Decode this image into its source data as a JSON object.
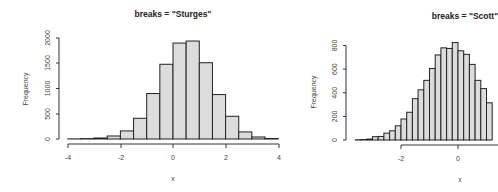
{
  "chart_data": [
    {
      "type": "bar",
      "subtype": "histogram",
      "title": "breaks = \"Sturges\"",
      "xlabel": "x",
      "ylabel": "Frequency",
      "bin_width": 0.5,
      "breaks": [
        -4,
        -3.5,
        -3,
        -2.5,
        -2,
        -1.5,
        -1,
        -0.5,
        0,
        0.5,
        1,
        1.5,
        2,
        2.5,
        3,
        3.5,
        4
      ],
      "values": [
        2,
        8,
        20,
        60,
        160,
        410,
        900,
        1480,
        1900,
        1940,
        1510,
        880,
        450,
        140,
        40,
        10
      ],
      "xticks": [
        -4,
        -2,
        0,
        2,
        4
      ],
      "yticks": [
        0,
        500,
        1000,
        1500,
        2000
      ],
      "xlim": [
        -4,
        4
      ],
      "ylim": [
        0,
        2000
      ],
      "grid": false
    },
    {
      "type": "bar",
      "subtype": "histogram",
      "title": "breaks = \"Scott\"",
      "xlabel": "x",
      "ylabel": "Frequency",
      "bin_width": 0.2,
      "breaks_start": -3.6,
      "values": [
        2,
        4,
        8,
        28,
        30,
        58,
        78,
        120,
        178,
        235,
        350,
        425,
        505,
        605,
        720,
        780,
        775,
        825,
        755,
        725,
        640,
        505,
        435,
        315
      ],
      "xticks": [
        -2,
        0
      ],
      "yticks": [
        0,
        200,
        400,
        600,
        800
      ],
      "ylim": [
        0,
        800
      ],
      "grid": false,
      "note": "right portion of figure cropped"
    }
  ],
  "left": {
    "title": "breaks = \"Sturges\"",
    "xlabel": "x",
    "ylabel": "Frequency",
    "xticks": [
      "-4",
      "-2",
      "0",
      "2",
      "4"
    ],
    "yticks": [
      "0",
      "500",
      "1000",
      "1500",
      "2000"
    ]
  },
  "right": {
    "title": "breaks = \"Scott\"",
    "xlabel": "x",
    "ylabel": "Frequency",
    "xticks": [
      "-2",
      "0"
    ],
    "yticks": [
      "0",
      "200",
      "400",
      "600",
      "800"
    ]
  },
  "colors": {
    "bar_fill": "#dcdcdc",
    "bar_stroke": "#222222",
    "background": "#ffffff"
  }
}
